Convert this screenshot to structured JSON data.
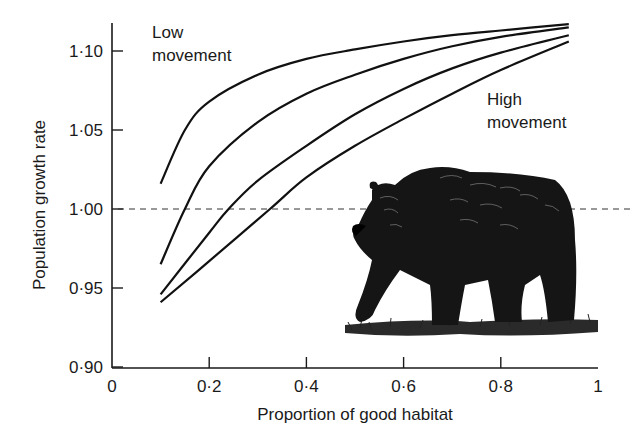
{
  "chart_data": {
    "type": "line",
    "title": "",
    "xlabel": "Proportion of good habitat",
    "ylabel": "Population growth rate",
    "xlim": [
      0,
      1
    ],
    "ylim": [
      0.9,
      1.12
    ],
    "xticks": [
      0,
      0.2,
      0.4,
      0.6,
      0.8,
      1
    ],
    "xtick_labels": [
      "0",
      "0·2",
      "0·4",
      "0·6",
      "0·8",
      "1"
    ],
    "yticks": [
      0.9,
      0.95,
      1.0,
      1.05,
      1.1
    ],
    "ytick_labels": [
      "0·90",
      "0·95",
      "1·00",
      "1·05",
      "1·10"
    ],
    "grid": false,
    "reference_line": {
      "y": 1.0,
      "style": "dashed"
    },
    "annotations": [
      {
        "text": [
          "Low",
          "movement"
        ],
        "near_series": "Low movement"
      },
      {
        "text": [
          "High",
          "movement"
        ],
        "near_series": "High movement"
      }
    ],
    "illustration": "grizzly bear walking on grass",
    "series": [
      {
        "name": "Low movement",
        "x": [
          0.1,
          0.15,
          0.2,
          0.3,
          0.4,
          0.5,
          0.6,
          0.7,
          0.8,
          0.94
        ],
        "y": [
          1.016,
          1.05,
          1.068,
          1.085,
          1.095,
          1.101,
          1.106,
          1.11,
          1.113,
          1.117
        ]
      },
      {
        "name": "Intermediate movement 1",
        "x": [
          0.1,
          0.15,
          0.2,
          0.3,
          0.4,
          0.5,
          0.6,
          0.7,
          0.8,
          0.94
        ],
        "y": [
          0.965,
          1.0,
          1.027,
          1.055,
          1.073,
          1.085,
          1.095,
          1.103,
          1.109,
          1.115
        ]
      },
      {
        "name": "Intermediate movement 2",
        "x": [
          0.1,
          0.2,
          0.24,
          0.3,
          0.4,
          0.5,
          0.6,
          0.7,
          0.8,
          0.94
        ],
        "y": [
          0.946,
          0.985,
          1.0,
          1.018,
          1.04,
          1.06,
          1.076,
          1.089,
          1.099,
          1.11
        ]
      },
      {
        "name": "High movement",
        "x": [
          0.1,
          0.2,
          0.325,
          0.4,
          0.5,
          0.6,
          0.7,
          0.8,
          0.94
        ],
        "y": [
          0.941,
          0.967,
          1.0,
          1.02,
          1.04,
          1.057,
          1.073,
          1.088,
          1.106
        ]
      }
    ]
  }
}
